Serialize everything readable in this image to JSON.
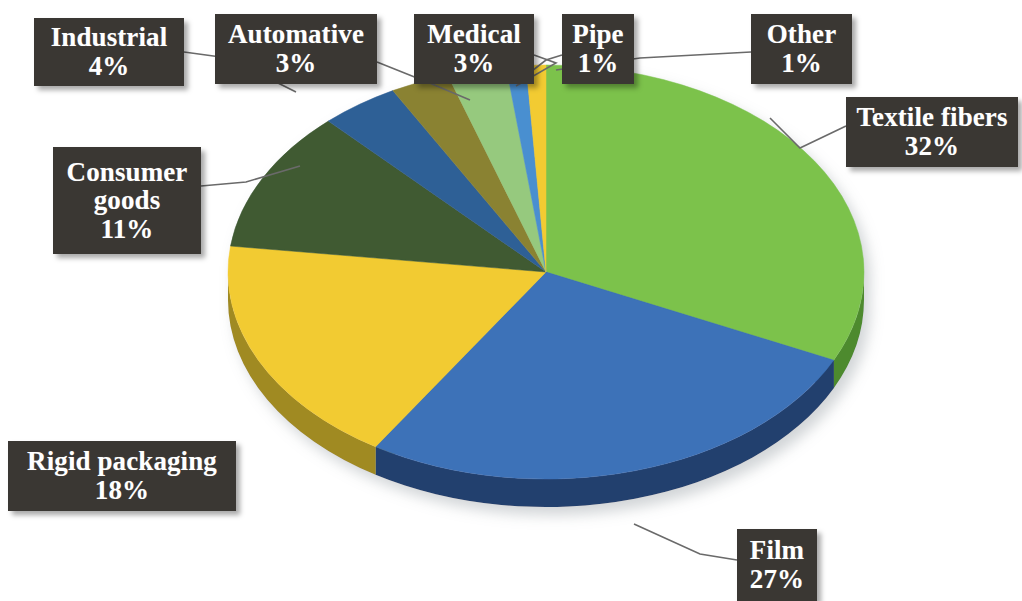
{
  "chart_data": {
    "type": "pie",
    "title": "",
    "subtitle": "",
    "xlabel": "",
    "ylabel": "",
    "legend_position": "callout-labels",
    "grid": false,
    "units": "percent",
    "categories": [
      "Textile fibers",
      "Film",
      "Rigid packaging",
      "Consumer goods",
      "Industrial",
      "Automative",
      "Medical",
      "Pipe",
      "Other"
    ],
    "values": [
      32,
      27,
      18,
      11,
      4,
      3,
      3,
      1,
      1
    ],
    "colors": [
      "#7cc24c",
      "#3c72b8",
      "#f2cb30",
      "#3f5a32",
      "#2f6096",
      "#8a8233",
      "#96c97e",
      "#4a8fd0",
      "#f2cb30"
    ],
    "slices": [
      {
        "label": "Textile fibers",
        "value": 32,
        "value_text": "32%",
        "color": "#7cc24c",
        "side_color": "#4e8a2e"
      },
      {
        "label": "Film",
        "value": 27,
        "value_text": "27%",
        "color": "#3c72b8",
        "side_color": "#24406e"
      },
      {
        "label": "Rigid packaging",
        "value": 18,
        "value_text": "18%",
        "color": "#f2cb30",
        "side_color": "#a08a22"
      },
      {
        "label": "Consumer goods",
        "value": 11,
        "value_text": "11%",
        "color": "#3f5a32",
        "side_color": "#2a3c21"
      },
      {
        "label": "Industrial",
        "value": 4,
        "value_text": "4%",
        "color": "#2f6096",
        "side_color": "#1e3d60"
      },
      {
        "label": "Automative",
        "value": 3,
        "value_text": "3%",
        "color": "#8a8233",
        "side_color": "#5c5622"
      },
      {
        "label": "Medical",
        "value": 3,
        "value_text": "3%",
        "color": "#96c97e",
        "side_color": "#638a50"
      },
      {
        "label": "Pipe",
        "value": 1,
        "value_text": "1%",
        "color": "#4a8fd0",
        "side_color": "#2d5c87"
      },
      {
        "label": "Other",
        "value": 1,
        "value_text": "1%",
        "color": "#f2cb30",
        "side_color": "#a08a22"
      }
    ]
  },
  "labels": {
    "industrial": {
      "name": "Industrial",
      "value": "4%"
    },
    "automotive": {
      "name": "Automative",
      "value": "3%"
    },
    "medical": {
      "name": "Medical",
      "value": "3%"
    },
    "pipe": {
      "name": "Pipe",
      "value": "1%"
    },
    "other": {
      "name": "Other",
      "value": "1%"
    },
    "textile_fibers": {
      "name": "Textile fibers",
      "value": "32%"
    },
    "consumer_goods": {
      "name": "Consumer goods",
      "value": "11%"
    },
    "rigid_packaging": {
      "name": "Rigid packaging",
      "value": "18%"
    },
    "film": {
      "name": "Film",
      "value": "27%"
    }
  },
  "style": {
    "label_background": "#3a3733",
    "label_text_color": "#ffffff",
    "leader_line_color": "#6a6a6a",
    "canvas_background": "#ffffff"
  }
}
